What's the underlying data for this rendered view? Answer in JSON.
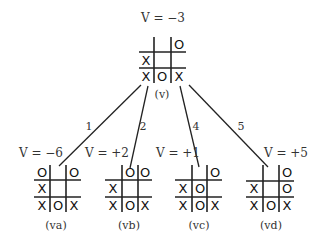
{
  "root": {
    "value_label": "V = −3",
    "node_label": "(v)",
    "board": [
      [
        "",
        "",
        "O"
      ],
      [
        "X",
        "",
        ""
      ],
      [
        "X",
        "O",
        "X"
      ]
    ]
  },
  "edges": [
    {
      "label": "1",
      "to": "va"
    },
    {
      "label": "2",
      "to": "vb"
    },
    {
      "label": "4",
      "to": "vc"
    },
    {
      "label": "5",
      "to": "vd"
    }
  ],
  "children": [
    {
      "id": "va",
      "value_label": "V = −6",
      "node_label": "(va)",
      "board": [
        [
          "O",
          "",
          "O"
        ],
        [
          "X",
          "",
          ""
        ],
        [
          "X",
          "O",
          "X"
        ]
      ]
    },
    {
      "id": "vb",
      "value_label": "V = +2",
      "node_label": "(vb)",
      "board": [
        [
          "",
          "O",
          "O"
        ],
        [
          "X",
          "",
          ""
        ],
        [
          "X",
          "O",
          "X"
        ]
      ]
    },
    {
      "id": "vc",
      "value_label": "V = +1",
      "node_label": "(vc)",
      "board": [
        [
          "",
          "",
          "O"
        ],
        [
          "X",
          "O",
          ""
        ],
        [
          "X",
          "O",
          "X"
        ]
      ]
    },
    {
      "id": "vd",
      "value_label": "V = +5",
      "node_label": "(vd)",
      "board": [
        [
          "",
          "",
          "O"
        ],
        [
          "X",
          "",
          "O"
        ],
        [
          "X",
          "O",
          "X"
        ]
      ]
    }
  ],
  "colors": {
    "ink": "#222222",
    "text": "#333333",
    "background": "#ffffff"
  }
}
